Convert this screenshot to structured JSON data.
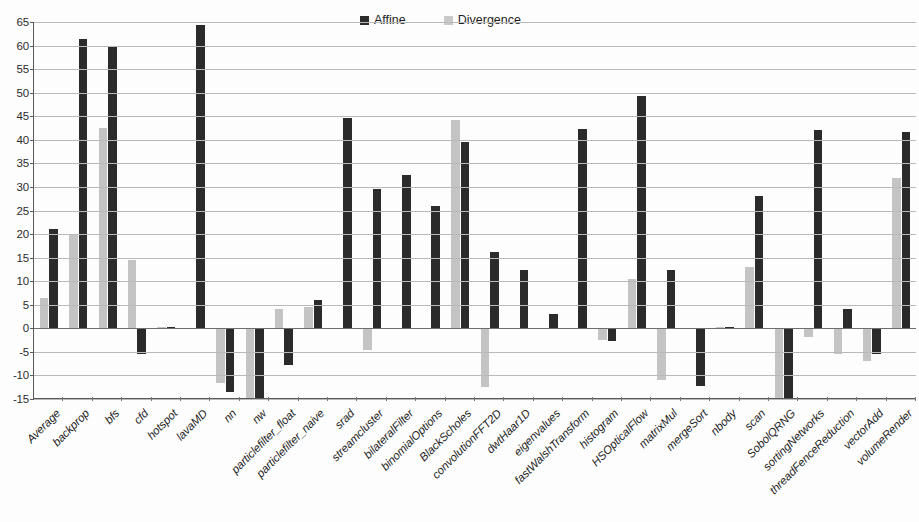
{
  "chart_data": {
    "type": "bar",
    "title": "",
    "subtitle": "",
    "xlabel": "",
    "ylabel": "",
    "ylim": [
      -15,
      65
    ],
    "ytick_step": 5,
    "yticks": [
      65,
      60,
      55,
      50,
      45,
      40,
      35,
      30,
      25,
      20,
      15,
      10,
      5,
      0,
      -5,
      -10,
      -15
    ],
    "grid": true,
    "legend_position": "top-center",
    "categories": [
      "Average",
      "backprop",
      "bfs",
      "cfd",
      "hotspot",
      "lavaMD",
      "nn",
      "nw",
      "particlefilter_float",
      "particlefilter_naive",
      "srad",
      "streamcluster",
      "bilateralFilter",
      "binomialOptions",
      "BlackScholes",
      "convolutionFFT2D",
      "dwtHaar1D",
      "eigenvalues",
      "fastWalshTransform",
      "histogram",
      "HSOpticalFlow",
      "matrixMul",
      "mergeSort",
      "nbody",
      "scan",
      "SobolQRNG",
      "sortingNetworks",
      "threadFenceReduction",
      "vectorAdd",
      "volumeRender"
    ],
    "series": [
      {
        "name": "Divergence",
        "color": "#c4c4c4",
        "values": [
          6.5,
          20.0,
          42.5,
          14.5,
          0.2,
          0,
          -11.5,
          -15.0,
          4.0,
          4.5,
          0,
          -4.5,
          0,
          0,
          44.3,
          -12.5,
          0,
          0,
          0,
          -2.5,
          10.5,
          -11.0,
          0,
          0.2,
          13.0,
          -14.8,
          -1.8,
          -5.5,
          -7.0,
          32.0
        ]
      },
      {
        "name": "Affine",
        "color": "#2b2b2b",
        "values": [
          21.0,
          61.3,
          59.9,
          -5.5,
          0.2,
          64.3,
          -13.5,
          -15.0,
          -7.8,
          6.0,
          44.7,
          29.5,
          32.6,
          25.9,
          39.5,
          16.1,
          12.3,
          3.1,
          42.4,
          -2.7,
          49.3,
          12.4,
          -12.3,
          0.2,
          28.0,
          -15.0,
          42.0,
          4.0,
          -5.5,
          41.7
        ]
      }
    ]
  },
  "legend": {
    "entries": [
      {
        "label": "Affine",
        "key": "affine"
      },
      {
        "label": "Divergence",
        "key": "divergence"
      }
    ]
  }
}
